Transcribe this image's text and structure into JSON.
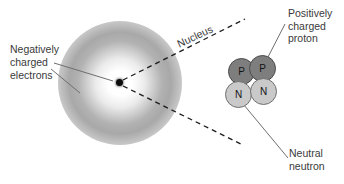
{
  "diagram_title": "Atom structure: electron cloud and nucleus",
  "labels": {
    "electrons": [
      "Negatively",
      "charged",
      "electrons"
    ],
    "nucleus": "Nucleus",
    "proton": [
      "Positively",
      "charged",
      "proton"
    ],
    "neutron": [
      "Neutral",
      "neutron"
    ]
  },
  "particles": {
    "p1": "P",
    "p2": "P",
    "n1": "N",
    "n2": "N"
  },
  "colors": {
    "proton_fill": "#7e7e7e",
    "proton_outline": "#4a4a4a",
    "neutron_fill": "#c9c9c9",
    "neutron_outline": "#6f6f6f",
    "electron_cloud_gray": "#a6a6a6",
    "nucleus_dot": "#0d0d0d",
    "dashed_line": "#1c1c1c",
    "leader_line": "#6e6e6e",
    "label_text": "#3a3a3a",
    "background": "#ffffff"
  }
}
